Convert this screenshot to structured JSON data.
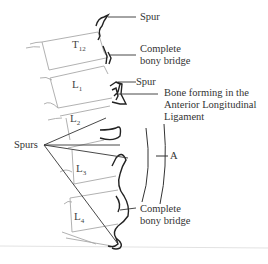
{
  "diagram": {
    "vertebrae": [
      {
        "name": "T",
        "sub": "12"
      },
      {
        "name": "L",
        "sub": "1"
      },
      {
        "name": "L",
        "sub": "2"
      },
      {
        "name": "L",
        "sub": "3"
      },
      {
        "name": "L",
        "sub": "4"
      }
    ],
    "labels": {
      "spur_top": "Spur",
      "bridge_top_1": "Complete",
      "bridge_top_2": "bony bridge",
      "spur_mid": "Spur",
      "bone_all_1": "Bone forming in the",
      "bone_all_2": "Anterior Longitudinal",
      "bone_all_3": "Ligament",
      "spurs_left": "Spurs",
      "bracket_a": "A",
      "bridge_bottom_1": "Complete",
      "bridge_bottom_2": "bony bridge"
    },
    "colors": {
      "outline": "#222222",
      "vertebra_outline": "#9a9a9a",
      "text": "#333333"
    }
  }
}
